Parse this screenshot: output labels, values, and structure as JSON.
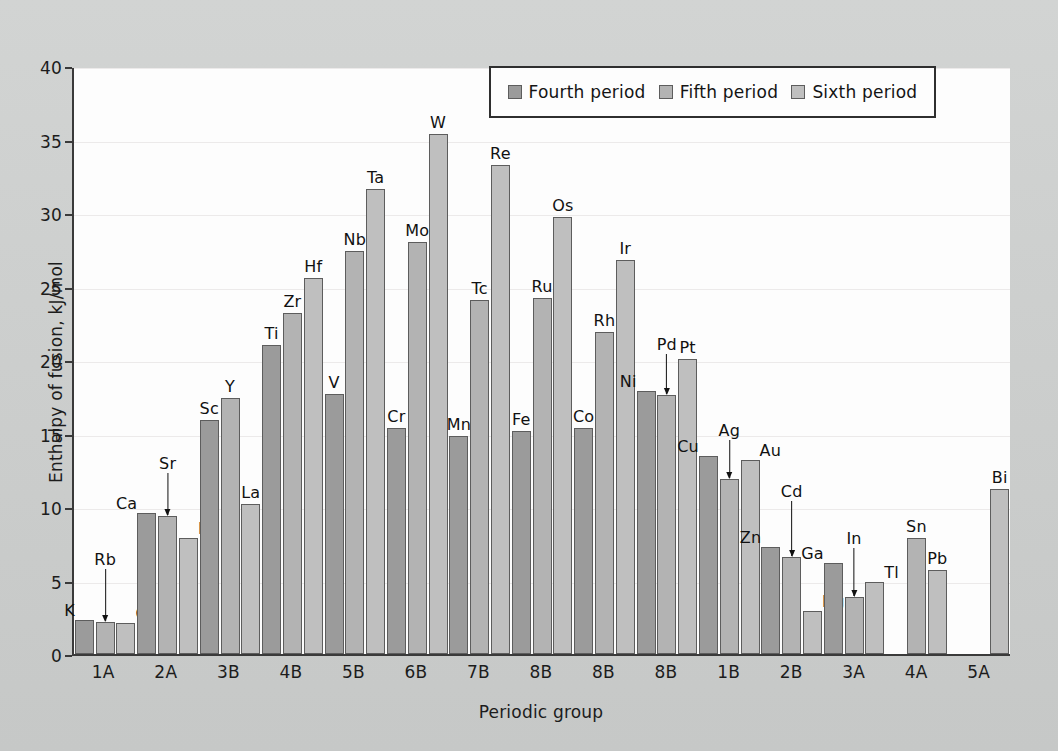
{
  "chart_data": {
    "type": "bar",
    "title": "",
    "xlabel": "Periodic group",
    "ylabel": "Enthalpy of fusion, kJ/mol",
    "ylim": [
      0,
      40
    ],
    "yticks": [
      0,
      5,
      10,
      15,
      20,
      25,
      30,
      35,
      40
    ],
    "grid": true,
    "legend_position": "top-right",
    "categories": [
      "1A",
      "2A",
      "3B",
      "4B",
      "5B",
      "6B",
      "7B",
      "8B",
      "8B",
      "8B",
      "1B",
      "2B",
      "3A",
      "4A",
      "5A"
    ],
    "series": [
      {
        "name": "Fourth period",
        "color": "#9b9b9b",
        "values": [
          2.3,
          9.6,
          15.9,
          21.0,
          17.7,
          15.4,
          14.8,
          15.2,
          15.4,
          17.9,
          13.5,
          7.3,
          6.2,
          null,
          null
        ]
      },
      {
        "name": "Fifth period",
        "color": "#b3b3b3",
        "values": [
          2.2,
          9.4,
          17.4,
          23.2,
          27.4,
          28.0,
          24.1,
          24.2,
          21.9,
          17.6,
          11.9,
          6.6,
          3.9,
          7.9,
          null
        ]
      },
      {
        "name": "Sixth period",
        "color": "#bfbfbf",
        "values": [
          2.1,
          7.9,
          10.2,
          25.6,
          31.6,
          35.4,
          33.3,
          29.7,
          26.8,
          20.1,
          13.2,
          2.9,
          4.9,
          5.7,
          11.2
        ]
      }
    ],
    "groups": [
      {
        "group": "1A",
        "bars": [
          {
            "element": "K",
            "period": "p4",
            "value": 2.3,
            "label_style": "side-left"
          },
          {
            "element": "Rb",
            "period": "p5",
            "value": 2.2,
            "label_style": "callout",
            "callout_height": 52
          },
          {
            "element": "Cs",
            "period": "p6",
            "value": 2.1,
            "label_style": "side-right"
          }
        ]
      },
      {
        "group": "2A",
        "bars": [
          {
            "element": "Ca",
            "period": "p4",
            "value": 9.6,
            "label_style": "side-left"
          },
          {
            "element": "Sr",
            "period": "p5",
            "value": 9.4,
            "label_style": "callout",
            "callout_height": 42
          },
          {
            "element": "Ba",
            "period": "p6",
            "value": 7.9,
            "label_style": "side-right"
          }
        ]
      },
      {
        "group": "3B",
        "bars": [
          {
            "element": "Sc",
            "period": "p4",
            "value": 15.9,
            "label_style": "top"
          },
          {
            "element": "Y",
            "period": "p5",
            "value": 17.4,
            "label_style": "top"
          },
          {
            "element": "La",
            "period": "p6",
            "value": 10.2,
            "label_style": "top"
          }
        ]
      },
      {
        "group": "4B",
        "bars": [
          {
            "element": "Ti",
            "period": "p4",
            "value": 21.0,
            "label_style": "top"
          },
          {
            "element": "Zr",
            "period": "p5",
            "value": 23.2,
            "label_style": "top"
          },
          {
            "element": "Hf",
            "period": "p6",
            "value": 25.6,
            "label_style": "top"
          }
        ]
      },
      {
        "group": "5B",
        "bars": [
          {
            "element": "V",
            "period": "p4",
            "value": 17.7,
            "label_style": "top"
          },
          {
            "element": "Nb",
            "period": "p5",
            "value": 27.4,
            "label_style": "top"
          },
          {
            "element": "Ta",
            "period": "p6",
            "value": 31.6,
            "label_style": "top"
          }
        ]
      },
      {
        "group": "6B",
        "bars": [
          {
            "element": "Cr",
            "period": "p4",
            "value": 15.4,
            "label_style": "top"
          },
          {
            "element": "Mo",
            "period": "p5",
            "value": 28.0,
            "label_style": "top"
          },
          {
            "element": "W",
            "period": "p6",
            "value": 35.4,
            "label_style": "top"
          }
        ]
      },
      {
        "group": "7B",
        "bars": [
          {
            "element": "Mn",
            "period": "p4",
            "value": 14.8,
            "label_style": "top"
          },
          {
            "element": "Tc",
            "period": "p5",
            "value": 24.1,
            "label_style": "top"
          },
          {
            "element": "Re",
            "period": "p6",
            "value": 33.3,
            "label_style": "top"
          }
        ]
      },
      {
        "group": "8B",
        "bars": [
          {
            "element": "Fe",
            "period": "p4",
            "value": 15.2,
            "label_style": "top"
          },
          {
            "element": "Ru",
            "period": "p5",
            "value": 24.2,
            "label_style": "top"
          },
          {
            "element": "Os",
            "period": "p6",
            "value": 29.7,
            "label_style": "top"
          }
        ]
      },
      {
        "group": "8B",
        "bars": [
          {
            "element": "Co",
            "period": "p4",
            "value": 15.4,
            "label_style": "top"
          },
          {
            "element": "Rh",
            "period": "p5",
            "value": 21.9,
            "label_style": "top"
          },
          {
            "element": "Ir",
            "period": "p6",
            "value": 26.8,
            "label_style": "top"
          }
        ]
      },
      {
        "group": "8B",
        "bars": [
          {
            "element": "Ni",
            "period": "p4",
            "value": 17.9,
            "label_style": "side-left"
          },
          {
            "element": "Pd",
            "period": "p5",
            "value": 17.6,
            "label_style": "callout",
            "callout_height": 40
          },
          {
            "element": "Pt",
            "period": "p6",
            "value": 20.1,
            "label_style": "top"
          }
        ]
      },
      {
        "group": "1B",
        "bars": [
          {
            "element": "Cu",
            "period": "p4",
            "value": 13.5,
            "label_style": "side-left"
          },
          {
            "element": "Ag",
            "period": "p5",
            "value": 11.9,
            "label_style": "callout",
            "callout_height": 38
          },
          {
            "element": "Au",
            "period": "p6",
            "value": 13.2,
            "label_style": "side-right"
          }
        ]
      },
      {
        "group": "2B",
        "bars": [
          {
            "element": "Zn",
            "period": "p4",
            "value": 7.3,
            "label_style": "side-left"
          },
          {
            "element": "Cd",
            "period": "p5",
            "value": 6.6,
            "label_style": "callout",
            "callout_height": 55
          },
          {
            "element": "Hg",
            "period": "p6",
            "value": 2.9,
            "label_style": "side-right"
          }
        ]
      },
      {
        "group": "3A",
        "bars": [
          {
            "element": "Ga",
            "period": "p4",
            "value": 6.2,
            "label_style": "side-left"
          },
          {
            "element": "In",
            "period": "p5",
            "value": 3.9,
            "label_style": "callout",
            "callout_height": 48
          },
          {
            "element": "Tl",
            "period": "p6",
            "value": 4.9,
            "label_style": "side-right"
          }
        ]
      },
      {
        "group": "4A",
        "bars": [
          {
            "element": "Sn",
            "period": "p5",
            "value": 7.9,
            "slot": 1,
            "label_style": "top"
          },
          {
            "element": "Pb",
            "period": "p6",
            "value": 5.7,
            "slot": 2,
            "label_style": "top"
          }
        ]
      },
      {
        "group": "5A",
        "bars": [
          {
            "element": "Bi",
            "period": "p6",
            "value": 11.2,
            "slot": 2,
            "label_style": "top"
          }
        ]
      }
    ]
  },
  "legend": {
    "entries": [
      {
        "label": "Fourth period",
        "period": "p4"
      },
      {
        "label": "Fifth period",
        "period": "p5"
      },
      {
        "label": "Sixth period",
        "period": "p6"
      }
    ]
  }
}
